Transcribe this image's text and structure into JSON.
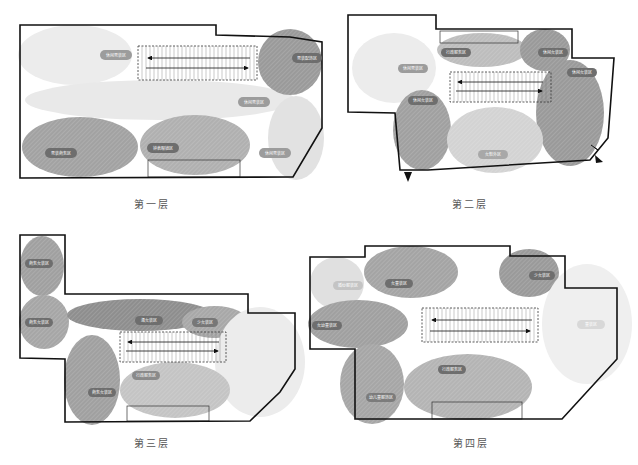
{
  "colors": {
    "dark": "#8a8a8a",
    "mid": "#a6a6a6",
    "light": "#cfcfcf",
    "vlight": "#e6e6e6",
    "wall": "#111111",
    "label_bg": "#6e6e6e"
  },
  "floors": [
    {
      "caption": "第一层",
      "labels": [
        "休闲男装区",
        "男装配饰区",
        "休闲男装区",
        "男装商务区",
        "钟表眼镜区",
        "休闲男装区"
      ]
    },
    {
      "caption": "第二层",
      "labels": [
        "休闲男装区",
        "行政服务区",
        "休闲女装区",
        "休闲女装区",
        "休闲女装区",
        "女鞋外区"
      ]
    },
    {
      "caption": "第三层",
      "labels": [
        "商务女装区",
        "商务女装区",
        "淑女装区",
        "少女装区",
        "商务女装区",
        "行政服务区"
      ]
    },
    {
      "caption": "第四层",
      "labels": [
        "婚纱服装区",
        "女童装区",
        "少女装区",
        "女幼童装区",
        "童装区",
        "行政服务区",
        "幼儿童服饰区"
      ]
    }
  ]
}
